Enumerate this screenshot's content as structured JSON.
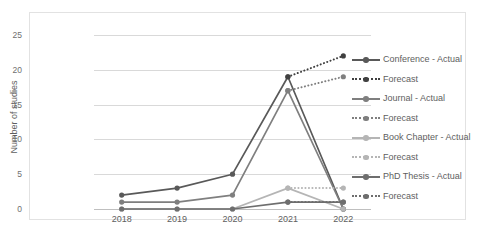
{
  "chart_data": {
    "type": "line",
    "title": "",
    "xlabel": "",
    "ylabel": "Number of studies",
    "categories": [
      "2018",
      "2019",
      "2020",
      "2021",
      "2022"
    ],
    "ylim": [
      0,
      25
    ],
    "yticks": [
      "0",
      "5",
      "10",
      "15",
      "20",
      "25"
    ],
    "grid": true,
    "legend_position": "right",
    "series": [
      {
        "name": "Conference - Actual",
        "style": "solid",
        "color": "#595959",
        "x": [
          "2018",
          "2019",
          "2020",
          "2021",
          "2022"
        ],
        "values": [
          2,
          3,
          5,
          19,
          0
        ]
      },
      {
        "name": "Forecast",
        "legend_label": "Forecast",
        "parent": "Conference",
        "style": "dotted",
        "color": "#404040",
        "x": [
          "2021",
          "2022"
        ],
        "values": [
          19,
          22
        ]
      },
      {
        "name": "Journal - Actual",
        "style": "solid",
        "color": "#7f7f7f",
        "x": [
          "2018",
          "2019",
          "2020",
          "2021",
          "2022"
        ],
        "values": [
          1,
          1,
          2,
          17,
          0
        ]
      },
      {
        "name": "Forecast",
        "legend_label": "Forecast",
        "parent": "Journal",
        "style": "dotted",
        "color": "#7f7f7f",
        "x": [
          "2021",
          "2022"
        ],
        "values": [
          17,
          19
        ]
      },
      {
        "name": "Book Chapter - Actual",
        "style": "solid",
        "color": "#b5b5b5",
        "x": [
          "2018",
          "2019",
          "2020",
          "2021",
          "2022"
        ],
        "values": [
          0,
          0,
          0,
          3,
          0
        ]
      },
      {
        "name": "Forecast",
        "legend_label": "Forecast",
        "parent": "Book Chapter",
        "style": "dotted",
        "color": "#b5b5b5",
        "x": [
          "2021",
          "2022"
        ],
        "values": [
          3,
          3
        ]
      },
      {
        "name": "PhD Thesis - Actual",
        "style": "solid",
        "color": "#6e6e6e",
        "x": [
          "2018",
          "2019",
          "2020",
          "2021",
          "2022"
        ],
        "values": [
          0,
          0,
          0,
          1,
          1
        ]
      },
      {
        "name": "Forecast",
        "legend_label": "Forecast",
        "parent": "PhD Thesis",
        "style": "dotted",
        "color": "#6e6e6e",
        "x": [
          "2021",
          "2022"
        ],
        "values": [
          1,
          1
        ]
      }
    ]
  },
  "legend": {
    "items": [
      {
        "label": "Conference - Actual",
        "style": "solid",
        "color": "#595959"
      },
      {
        "label": "Forecast",
        "style": "dotted",
        "color": "#404040"
      },
      {
        "label": "Journal - Actual",
        "style": "solid",
        "color": "#7f7f7f"
      },
      {
        "label": "Forecast",
        "style": "dotted",
        "color": "#7f7f7f"
      },
      {
        "label": "Book Chapter - Actual",
        "style": "solid",
        "color": "#b5b5b5"
      },
      {
        "label": "Forecast",
        "style": "dotted",
        "color": "#b5b5b5"
      },
      {
        "label": "PhD Thesis - Actual",
        "style": "solid",
        "color": "#6e6e6e"
      },
      {
        "label": "Forecast",
        "style": "dotted",
        "color": "#6e6e6e"
      }
    ]
  }
}
